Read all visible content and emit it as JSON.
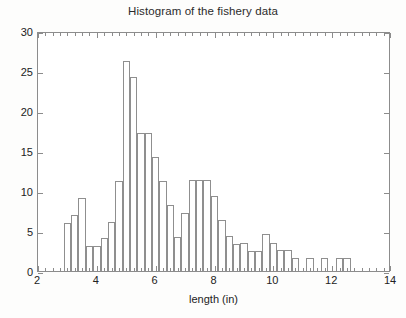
{
  "chart_data": {
    "type": "bar",
    "title": "Histogram of the fishery data",
    "subtitle": "",
    "xlabel": "length (in)",
    "ylabel": "",
    "xlim": [
      2,
      14
    ],
    "ylim": [
      0,
      30
    ],
    "grid": false,
    "legend": null,
    "bin_width": 0.25,
    "xticks": [
      2,
      4,
      6,
      8,
      10,
      12,
      14
    ],
    "xtick_labels": [
      "2",
      "4",
      "6",
      "8",
      "10",
      "12",
      "14"
    ],
    "yticks": [
      0,
      5,
      10,
      15,
      20,
      25,
      30
    ],
    "ytick_labels": [
      "0",
      "5",
      "10",
      "15",
      "20",
      "25",
      "30"
    ],
    "bin_starts": [
      2.875,
      3.125,
      3.375,
      3.625,
      3.875,
      4.125,
      4.375,
      4.625,
      4.875,
      5.125,
      5.375,
      5.625,
      5.875,
      6.125,
      6.375,
      6.625,
      6.875,
      7.125,
      7.375,
      7.625,
      7.875,
      8.125,
      8.375,
      8.625,
      8.875,
      9.125,
      9.375,
      9.625,
      9.875,
      10.125,
      10.375,
      10.625,
      11.125,
      11.625,
      12.125,
      12.375
    ],
    "values": [
      6,
      7,
      9.1,
      3.1,
      3.1,
      4.1,
      6.1,
      11.2,
      26.2,
      24.3,
      17.2,
      17.2,
      14.2,
      11.3,
      8.3,
      4.3,
      7.3,
      11.4,
      11.4,
      11.4,
      9.4,
      6.4,
      4.4,
      3.4,
      3.5,
      2.5,
      2.5,
      4.6,
      3.5,
      2.6,
      2.6,
      1.6,
      1.6,
      1.6,
      1.6,
      1.6
    ],
    "series": [
      {
        "name": "fishery length frequency",
        "values": [
          6,
          7,
          9.1,
          3.1,
          3.1,
          4.1,
          6.1,
          11.2,
          26.2,
          24.3,
          17.2,
          17.2,
          14.2,
          11.3,
          8.3,
          4.3,
          7.3,
          11.4,
          11.4,
          11.4,
          9.4,
          6.4,
          4.4,
          3.4,
          3.5,
          2.5,
          2.5,
          4.6,
          3.5,
          2.6,
          2.6,
          1.6,
          1.6,
          1.6,
          1.6,
          1.6
        ]
      }
    ]
  },
  "colors": {
    "axis": "#8c8c8c",
    "bar_stroke": "#8f8f8f",
    "bar_fill": "transparent",
    "text": "#222222",
    "background": "#ffffff"
  }
}
